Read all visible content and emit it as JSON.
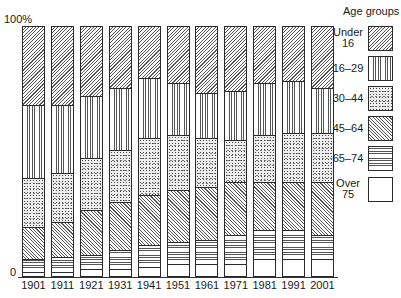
{
  "chart_data": {
    "type": "bar",
    "stacked": true,
    "normalized": true,
    "title": "",
    "xlabel": "",
    "ylabel": "",
    "y_tick_labels": [
      "100%",
      "0"
    ],
    "ylim": [
      0,
      100
    ],
    "grid": false,
    "legend_position": "right",
    "legend_title": "Age groups",
    "categories": [
      "1901",
      "1911",
      "1921",
      "1931",
      "1941",
      "1951",
      "1961",
      "1971",
      "1981",
      "1991",
      "2001"
    ],
    "series": [
      {
        "name": "Under 16",
        "pattern": "diagonal-hatch-right",
        "values": [
          32,
          32,
          28,
          25,
          21,
          23,
          27,
          26,
          23,
          22,
          25
        ]
      },
      {
        "name": "16–29",
        "pattern": "vertical-lines",
        "values": [
          29,
          27,
          25,
          25,
          24,
          21,
          18,
          20,
          21,
          21,
          18
        ]
      },
      {
        "name": "30–44",
        "pattern": "stipple-dots",
        "values": [
          20,
          20,
          21,
          21,
          23,
          22,
          20,
          17,
          19,
          20,
          20
        ]
      },
      {
        "name": "45–64",
        "pattern": "diagonal-hatch-left",
        "values": [
          13,
          14,
          18,
          19,
          20,
          21,
          21,
          21,
          19,
          19,
          21
        ]
      },
      {
        "name": "65–74",
        "pattern": "horizontal-lines",
        "values": [
          5,
          6,
          6,
          8,
          9,
          9,
          10,
          12,
          12,
          12,
          10
        ]
      },
      {
        "name": "Over 75",
        "pattern": "blank",
        "values": [
          1,
          1,
          2,
          2,
          3,
          4,
          4,
          4,
          6,
          6,
          6
        ]
      }
    ]
  },
  "axis": {
    "top_label": "100%",
    "bottom_label": "0"
  },
  "legend": {
    "title": "Age groups",
    "items": [
      {
        "line1": "Under",
        "line2": "16"
      },
      {
        "line1": "16–29",
        "line2": ""
      },
      {
        "line1": "30–44",
        "line2": ""
      },
      {
        "line1": "45–64",
        "line2": ""
      },
      {
        "line1": "65–74",
        "line2": ""
      },
      {
        "line1": "Over",
        "line2": "75"
      }
    ]
  }
}
